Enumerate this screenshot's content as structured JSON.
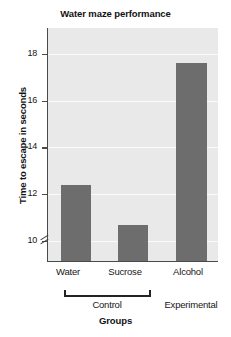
{
  "chart_data": {
    "type": "bar",
    "title": "Water maze performance",
    "xlabel": "Groups",
    "ylabel": "Time to escape in seconds",
    "categories": [
      "Water",
      "Sucrose",
      "Alcohol"
    ],
    "values": [
      12.4,
      10.7,
      17.6
    ],
    "series": [
      {
        "name": "Time to escape in seconds",
        "values": [
          12.4,
          10.7,
          17.6
        ]
      }
    ],
    "ylim": [
      9.1,
      19.1
    ],
    "yticks": [
      10,
      12,
      14,
      16,
      18
    ],
    "ytick_labels": [
      "10",
      "12",
      "14",
      "16",
      "18"
    ],
    "y_axis_break": true,
    "y_axis_break_symbol": "//",
    "grid": true,
    "grid_axis": "y",
    "legend": "none",
    "bar_color": "#6d6d6d",
    "plot_background": "#e9e9e9",
    "gridline_color": "#fbfbfb",
    "axis_color": "#4a4a4a",
    "group_annotations": [
      {
        "label": "Control",
        "categories": [
          "Water",
          "Sucrose"
        ],
        "bracket": true
      },
      {
        "label": "Experimental",
        "categories": [
          "Alcohol"
        ],
        "bracket": false
      }
    ]
  }
}
